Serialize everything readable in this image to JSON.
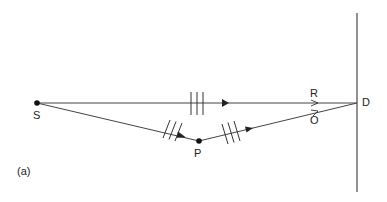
{
  "diagram": {
    "colors": {
      "line": "#333333",
      "background": "#ffffff"
    },
    "points": {
      "S": {
        "label": "S",
        "x": 37,
        "y": 103
      },
      "P": {
        "label": "P",
        "x": 199,
        "y": 141
      },
      "D": {
        "label": "D",
        "x": 357,
        "y": 103
      }
    },
    "labels": {
      "S": "S",
      "P": "P",
      "D": "D",
      "R": "R",
      "O": "O",
      "panel": "(a)"
    },
    "rays": [
      {
        "name": "direct-ray-S-to-D",
        "from": "S",
        "to": "D",
        "wavefront_marks": 3,
        "label": "R"
      },
      {
        "name": "ray-S-to-P",
        "from": "S",
        "to": "P",
        "wavefront_marks": 3
      },
      {
        "name": "ray-P-to-D",
        "from": "P",
        "to": "D",
        "wavefront_marks": 3,
        "label": "O"
      }
    ],
    "detector_plane": {
      "x": 357,
      "y_top": 13,
      "y_bottom": 192
    }
  }
}
